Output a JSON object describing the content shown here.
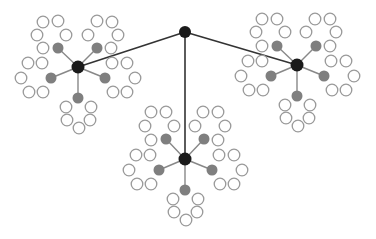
{
  "diagram": {
    "type": "tree",
    "colors": {
      "root": "#1a1a1a",
      "hub": "#1a1a1a",
      "branch": "#7f7f7f",
      "leaf_stroke": "#999999",
      "leaf_fill": "#ffffff",
      "edge_main": "#333333",
      "edge_branch": "#888888"
    },
    "root": {
      "x": 185,
      "y": 32,
      "r": 6
    },
    "clusters": [
      {
        "hub": {
          "x": 78,
          "y": 67
        },
        "branches": [
          {
            "x": 58,
            "y": 48,
            "leaves": [
              [
                43,
                22
              ],
              [
                58,
                21
              ],
              [
                37,
                35
              ],
              [
                66,
                35
              ],
              [
                43,
                48
              ]
            ]
          },
          {
            "x": 97,
            "y": 48,
            "leaves": [
              [
                97,
                21
              ],
              [
                112,
                22
              ],
              [
                88,
                35
              ],
              [
                118,
                35
              ],
              [
                111,
                48
              ]
            ]
          },
          {
            "x": 51,
            "y": 78,
            "leaves": [
              [
                28,
                63
              ],
              [
                42,
                63
              ],
              [
                21,
                78
              ],
              [
                29,
                92
              ],
              [
                43,
                92
              ]
            ]
          },
          {
            "x": 105,
            "y": 78,
            "leaves": [
              [
                112,
                63
              ],
              [
                127,
                63
              ],
              [
                135,
                78
              ],
              [
                113,
                92
              ],
              [
                127,
                92
              ]
            ]
          },
          {
            "x": 78,
            "y": 98,
            "leaves": [
              [
                66,
                107
              ],
              [
                91,
                107
              ],
              [
                67,
                120
              ],
              [
                90,
                120
              ],
              [
                79,
                128
              ]
            ]
          }
        ]
      },
      {
        "hub": {
          "x": 297,
          "y": 65
        },
        "branches": [
          {
            "x": 277,
            "y": 46,
            "leaves": [
              [
                262,
                19
              ],
              [
                277,
                19
              ],
              [
                256,
                32
              ],
              [
                285,
                32
              ],
              [
                262,
                46
              ]
            ]
          },
          {
            "x": 316,
            "y": 46,
            "leaves": [
              [
                315,
                19
              ],
              [
                330,
                19
              ],
              [
                306,
                32
              ],
              [
                336,
                32
              ],
              [
                330,
                46
              ]
            ]
          },
          {
            "x": 271,
            "y": 76,
            "leaves": [
              [
                248,
                61
              ],
              [
                262,
                61
              ],
              [
                241,
                76
              ],
              [
                249,
                90
              ],
              [
                263,
                90
              ]
            ]
          },
          {
            "x": 324,
            "y": 76,
            "leaves": [
              [
                331,
                61
              ],
              [
                346,
                61
              ],
              [
                354,
                76
              ],
              [
                332,
                90
              ],
              [
                346,
                90
              ]
            ]
          },
          {
            "x": 297,
            "y": 96,
            "leaves": [
              [
                285,
                105
              ],
              [
                310,
                105
              ],
              [
                286,
                118
              ],
              [
                309,
                118
              ],
              [
                298,
                126
              ]
            ]
          }
        ]
      },
      {
        "hub": {
          "x": 185,
          "y": 159
        },
        "branches": [
          {
            "x": 166,
            "y": 139,
            "leaves": [
              [
                151,
                112
              ],
              [
                166,
                112
              ],
              [
                145,
                126
              ],
              [
                174,
                126
              ],
              [
                151,
                140
              ]
            ]
          },
          {
            "x": 204,
            "y": 139,
            "leaves": [
              [
                203,
                112
              ],
              [
                218,
                112
              ],
              [
                195,
                126
              ],
              [
                225,
                126
              ],
              [
                218,
                140
              ]
            ]
          },
          {
            "x": 159,
            "y": 170,
            "leaves": [
              [
                136,
                155
              ],
              [
                150,
                155
              ],
              [
                129,
                170
              ],
              [
                137,
                184
              ],
              [
                151,
                184
              ]
            ]
          },
          {
            "x": 212,
            "y": 170,
            "leaves": [
              [
                219,
                155
              ],
              [
                234,
                155
              ],
              [
                242,
                170
              ],
              [
                220,
                184
              ],
              [
                234,
                184
              ]
            ]
          },
          {
            "x": 185,
            "y": 190,
            "leaves": [
              [
                173,
                199
              ],
              [
                198,
                199
              ],
              [
                174,
                212
              ],
              [
                197,
                212
              ],
              [
                186,
                220
              ]
            ]
          }
        ]
      }
    ]
  }
}
